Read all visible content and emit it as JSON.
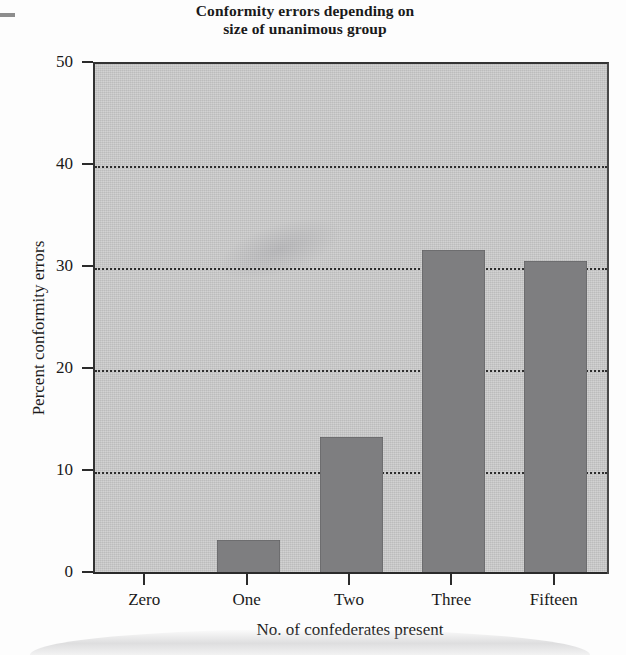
{
  "chart_data": {
    "type": "bar",
    "title": "Conformity errors depending on size of unanimous group",
    "title_lines": [
      "Conformity errors depending on",
      "size of unanimous group"
    ],
    "categories": [
      "Zero",
      "One",
      "Two",
      "Three",
      "Fifteen"
    ],
    "values": [
      0,
      3.3,
      13.4,
      31.8,
      30.7
    ],
    "xlabel": "No. of confederates present",
    "ylabel": "Percent conformity errors",
    "ylim": [
      0,
      50
    ],
    "yticks": [
      0,
      10,
      20,
      30,
      40,
      50
    ],
    "ytick_labels": [
      "0",
      "10",
      "20",
      "30",
      "40",
      "50"
    ],
    "gridlines": [
      10,
      20,
      30,
      40
    ],
    "grid": true,
    "grid_style": "dotted-horizontal",
    "legend": "none",
    "bar_color": "#7e7e80",
    "plot_background": "#c9c9c9",
    "page_background": "#fdfdfd",
    "axis_color": "#2b2b2b"
  }
}
